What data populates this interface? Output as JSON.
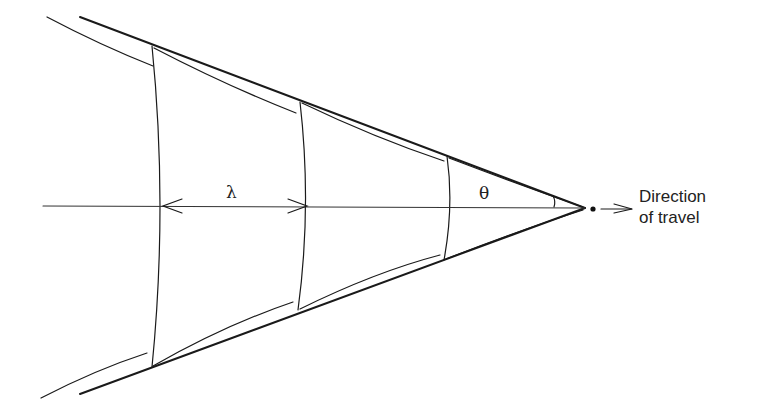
{
  "figure": {
    "labels": {
      "wavelength": "λ",
      "angle": "θ"
    },
    "caption": {
      "line1": "Direction",
      "line2": "of travel"
    },
    "geometry": {
      "apex": [
        585,
        208
      ],
      "axis_y": 206,
      "wavefronts_x": [
        152,
        300,
        447
      ]
    }
  }
}
